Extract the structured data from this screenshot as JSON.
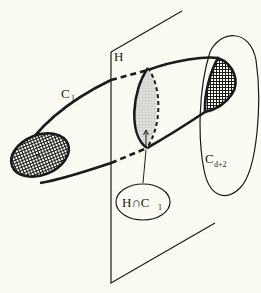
{
  "diagram": {
    "colors": {
      "background": "#fbfbf4",
      "ink": "#1a1a1a",
      "light_shade": "#d9d9d6"
    },
    "plane": {
      "label": "H"
    },
    "curve_c1": {
      "label_main": "C",
      "label_sub": "1"
    },
    "curve_cd2": {
      "label_main": "C",
      "label_sub": "d+2"
    },
    "intersection_callout": {
      "label_main": "H∩C",
      "label_sub": "1"
    }
  }
}
